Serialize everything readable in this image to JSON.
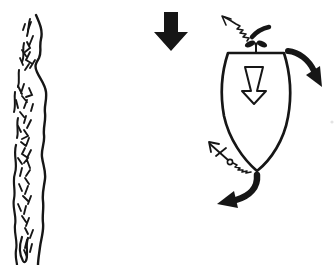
{
  "figure": {
    "type": "line-art-diagram",
    "colors": {
      "ink": "#161616",
      "background": "#ffffff",
      "paper_artifact": "#e3e3e3"
    },
    "elements": {
      "riverbank": {
        "label": "riverbank shoreline, hand-drawn wavy band with scribbled texture"
      },
      "current_arrow": {
        "label": "river current direction arrow",
        "direction": "down",
        "style": "solid-black-block-arrow"
      },
      "boat": {
        "label": "boat hull seen from above, bow pointing down, flat transom up"
      },
      "propeller": {
        "label": "propeller at stern",
        "style": "two-blade-solid"
      },
      "prop_wash_arrow": {
        "label": "propeller wash arrow",
        "direction": "up-left",
        "style": "thin-zigzag-open-head"
      },
      "thrust_stroke": {
        "label": "thrust motion stroke beside propeller",
        "style": "short-thick-curve"
      },
      "boat_motion_arrow": {
        "label": "boat movement arrow inside hull",
        "direction": "down",
        "style": "hollow-outline-tapered"
      },
      "stern_swing_arrow": {
        "label": "stern swing arrow",
        "direction": "down-right",
        "style": "thick-curved-solid"
      },
      "anchor": {
        "label": "anchor with stock and ring",
        "style": "thin-line-drawing"
      },
      "anchor_rode": {
        "label": "anchor rode from ring to bow",
        "style": "tight-zigzag-line"
      },
      "bow_swing_arrow": {
        "label": "bow swing arrow",
        "direction": "down-left",
        "style": "thick-curved-solid"
      },
      "speck": {
        "label": "faint paper speck at right edge"
      }
    }
  }
}
